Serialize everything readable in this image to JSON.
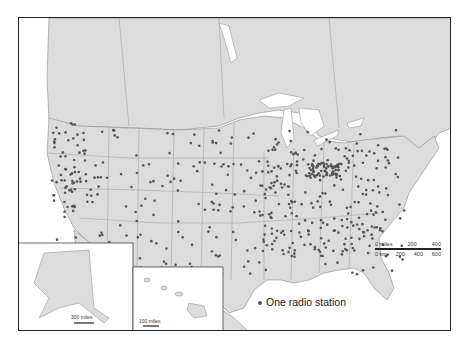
{
  "map": {
    "title": "",
    "legend": {
      "label": "One radio station",
      "dot_color": "#555555"
    },
    "scale_bar": {
      "miles_labels": [
        "0 miles",
        "200",
        "400"
      ],
      "km_labels": [
        "0 km",
        "200",
        "400",
        "600"
      ]
    },
    "insets": {
      "alaska": {
        "scale_label": "300 miles"
      },
      "hawaii": {
        "scale_label": "100 miles"
      }
    },
    "colors": {
      "land": "#dcdcdc",
      "water": "#ffffff",
      "border": "#8a8a8a",
      "dot": "#555555",
      "frame": "#222222"
    }
  }
}
